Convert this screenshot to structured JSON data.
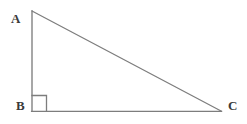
{
  "figure": {
    "type": "geometry-diagram",
    "shape": "right-triangle",
    "background_color": "#ffffff",
    "stroke_color": "#7d7d7d",
    "stroke_width": 1.3,
    "label_color": "#3a3a3a"
  },
  "labels": {
    "a": "A",
    "b": "B",
    "c": "C"
  },
  "geometry": {
    "vertices": {
      "A": {
        "x": 32,
        "y": 11
      },
      "B": {
        "x": 32,
        "y": 111
      },
      "C": {
        "x": 221,
        "y": 111
      }
    },
    "sides": [
      {
        "name": "leg-AB",
        "from": "A",
        "to": "B"
      },
      {
        "name": "leg-BC",
        "from": "B",
        "to": "C"
      },
      {
        "name": "hypotenuse-AC",
        "from": "A",
        "to": "C"
      }
    ],
    "right_angle": {
      "at_vertex": "B",
      "marker": "square",
      "size": 15
    }
  }
}
